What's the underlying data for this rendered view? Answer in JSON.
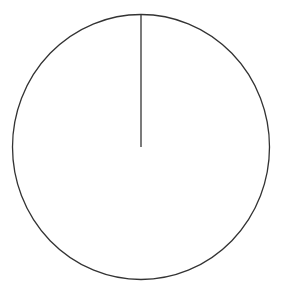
{
  "chart_data": {
    "type": "pie",
    "title": "",
    "categories": [
      ""
    ],
    "values": [
      100
    ],
    "labels": [],
    "legend": [],
    "start_angle_deg": 90,
    "geometry": {
      "cx": 141,
      "cy": 147,
      "rx": 128.5,
      "ry": 132.5
    },
    "style": {
      "fill": "#ffffff",
      "stroke": "#333333",
      "stroke_width": 1.3
    }
  }
}
